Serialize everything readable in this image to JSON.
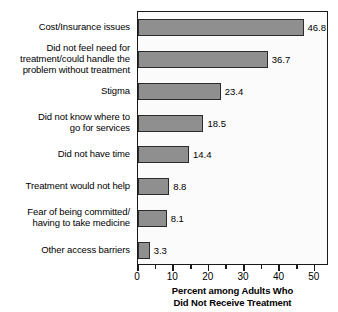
{
  "chart_data": {
    "type": "bar",
    "orientation": "horizontal",
    "title": "",
    "xlabel": "Percent among Adults Who Did Not Receive Treatment",
    "xlabel_lines": [
      "Percent among Adults Who",
      "Did Not Receive Treatment"
    ],
    "ylabel": "",
    "xlim": [
      0,
      54
    ],
    "xticks": [
      0,
      10,
      20,
      30,
      40,
      50
    ],
    "xtick_labels": [
      "0",
      "10",
      "20",
      "30",
      "40",
      "50"
    ],
    "minor_xticks": [
      5,
      15,
      25,
      35,
      45
    ],
    "grid": false,
    "legend": null,
    "bar_color": "#8f8f8f",
    "bar_edge_color": "#2b2b2b",
    "plot_background": "#fbfbfb",
    "axis_color": "#1a1a1a",
    "categories": [
      "Cost/Insurance issues",
      "Did not feel need for treatment/could handle the problem without treatment",
      "Stigma",
      "Did not know where to go for services",
      "Did not have time",
      "Treatment would not help",
      "Fear of being committed/having to take medicine",
      "Other access barriers"
    ],
    "category_lines": [
      [
        "Cost/Insurance issues"
      ],
      [
        "Did not feel need for",
        "treatment/could handle the",
        "problem without treatment"
      ],
      [
        "Stigma"
      ],
      [
        "Did not know where to",
        "go for services"
      ],
      [
        "Did not have time"
      ],
      [
        "Treatment would not help"
      ],
      [
        "Fear of being committed/",
        "having to take medicine"
      ],
      [
        "Other access barriers"
      ]
    ],
    "values": [
      46.8,
      36.7,
      23.4,
      18.5,
      14.4,
      8.8,
      8.1,
      3.3
    ],
    "value_labels": [
      "46.8",
      "36.7",
      "23.4",
      "18.5",
      "14.4",
      "8.8",
      "8.1",
      "3.3"
    ]
  }
}
